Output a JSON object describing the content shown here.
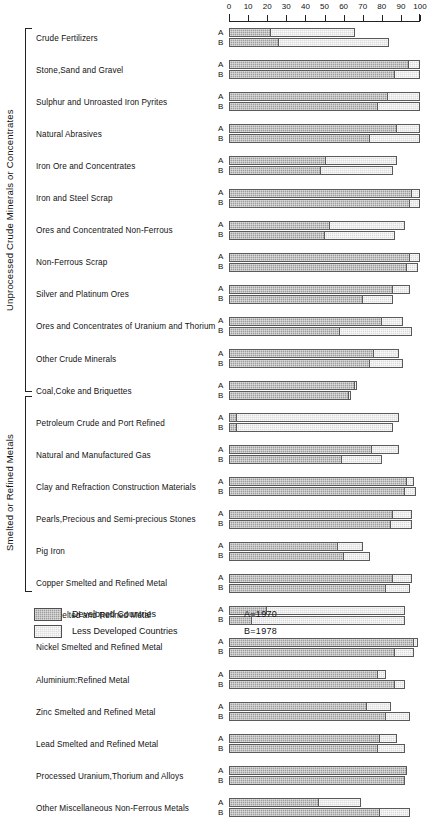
{
  "chart_data": {
    "type": "bar",
    "subtype": "grouped-stacked-horizontal",
    "title": "",
    "xlabel": "",
    "ylabel": "",
    "xlim": [
      0,
      100
    ],
    "xticks": [
      0,
      10,
      20,
      30,
      40,
      50,
      60,
      70,
      80,
      90,
      100
    ],
    "xtick_labels": [
      "0",
      "10",
      "20",
      "30",
      "40",
      "50",
      "60",
      "70",
      "80",
      "90",
      "100"
    ],
    "grid": false,
    "legend_position": "bottom-left",
    "series": [
      {
        "name": "Developed Countries",
        "key": "developed",
        "color": "#9d9d9d"
      },
      {
        "name": "Less Developed Countries",
        "key": "less_developed",
        "color": "#dcdcdc"
      }
    ],
    "row_series_tags": [
      {
        "tag": "A",
        "note": "A=1970"
      },
      {
        "tag": "B",
        "note": "B=1978"
      }
    ],
    "groups": [
      {
        "name": "Unprocessed Crude Minerals or Concentrates",
        "categories": [
          {
            "label": "Crude Fertilizers",
            "A": {
              "developed": 22,
              "less_developed": 44
            },
            "B": {
              "developed": 26,
              "less_developed": 58
            }
          },
          {
            "label": "Stone,Sand and Gravel",
            "A": {
              "developed": 94,
              "less_developed": 6
            },
            "B": {
              "developed": 87,
              "less_developed": 13
            }
          },
          {
            "label": "Sulphur and Unroasted Iron Pyrites",
            "A": {
              "developed": 83,
              "less_developed": 17
            },
            "B": {
              "developed": 78,
              "less_developed": 22
            }
          },
          {
            "label": "Natural Abrasives",
            "A": {
              "developed": 88,
              "less_developed": 12
            },
            "B": {
              "developed": 74,
              "less_developed": 26
            }
          },
          {
            "label": "Iron Ore and Concentrates",
            "A": {
              "developed": 51,
              "less_developed": 37
            },
            "B": {
              "developed": 48,
              "less_developed": 38
            }
          },
          {
            "label": "Iron and Steel Scrap",
            "A": {
              "developed": 96,
              "less_developed": 4
            },
            "B": {
              "developed": 95,
              "less_developed": 5
            }
          },
          {
            "label": "Ores and Concentrated Non-Ferrous",
            "A": {
              "developed": 53,
              "less_developed": 39
            },
            "B": {
              "developed": 50,
              "less_developed": 37
            }
          },
          {
            "label": "Non-Ferrous Scrap",
            "A": {
              "developed": 95,
              "less_developed": 5
            },
            "B": {
              "developed": 93,
              "less_developed": 6
            }
          },
          {
            "label": "Silver and Platinum Ores",
            "A": {
              "developed": 86,
              "less_developed": 9
            },
            "B": {
              "developed": 70,
              "less_developed": 16
            }
          },
          {
            "label": "Ores and Concentrates of Uranium and Thorium",
            "A": {
              "developed": 80,
              "less_developed": 11
            },
            "B": {
              "developed": 58,
              "less_developed": 38
            }
          },
          {
            "label": "Other Crude Minerals",
            "A": {
              "developed": 76,
              "less_developed": 13
            },
            "B": {
              "developed": 74,
              "less_developed": 17
            }
          },
          {
            "label": "Coal,Coke and Briquettes",
            "A": {
              "developed": 66,
              "less_developed": 1
            },
            "B": {
              "developed": 63,
              "less_developed": 1
            }
          },
          {
            "label": "Petroleum Crude and Port Refined",
            "A": {
              "developed": 4,
              "less_developed": 85
            },
            "B": {
              "developed": 4,
              "less_developed": 82
            }
          },
          {
            "label": "Natural and Manufactured Gas",
            "A": {
              "developed": 75,
              "less_developed": 14
            },
            "B": {
              "developed": 59,
              "less_developed": 21
            }
          },
          {
            "label": "Clay and Refraction Construction Materials",
            "A": {
              "developed": 93,
              "less_developed": 4
            },
            "B": {
              "developed": 92,
              "less_developed": 6
            }
          },
          {
            "label": "Pearls,Precious and Semi-precious Stones",
            "A": {
              "developed": 86,
              "less_developed": 10
            },
            "B": {
              "developed": 85,
              "less_developed": 11
            }
          }
        ]
      },
      {
        "name": "Smelted or Refined Metals",
        "categories": [
          {
            "label": "Pig Iron",
            "A": {
              "developed": 57,
              "less_developed": 13
            },
            "B": {
              "developed": 60,
              "less_developed": 14
            }
          },
          {
            "label": "Copper Smelted and Refined Metal",
            "A": {
              "developed": 86,
              "less_developed": 10
            },
            "B": {
              "developed": 82,
              "less_developed": 13
            }
          },
          {
            "label": "Tin Smelted and Refined Metal",
            "A": {
              "developed": 20,
              "less_developed": 72
            },
            "B": {
              "developed": 12,
              "less_developed": 80
            }
          },
          {
            "label": "Nickel Smelted and Refined Metal",
            "A": {
              "developed": 97,
              "less_developed": 2
            },
            "B": {
              "developed": 87,
              "less_developed": 10
            }
          },
          {
            "label": "Aluminium:Refined Metal",
            "A": {
              "developed": 78,
              "less_developed": 4
            },
            "B": {
              "developed": 87,
              "less_developed": 5
            }
          },
          {
            "label": "Zinc Smelted and Refined Metal",
            "A": {
              "developed": 72,
              "less_developed": 13
            },
            "B": {
              "developed": 82,
              "less_developed": 13
            }
          },
          {
            "label": "Lead Smelted and Refined Metal",
            "A": {
              "developed": 79,
              "less_developed": 9
            },
            "B": {
              "developed": 78,
              "less_developed": 14
            }
          },
          {
            "label": "Processed Uranium,Thorium and Alloys",
            "A": {
              "developed": 93,
              "less_developed": 0
            },
            "B": {
              "developed": 92,
              "less_developed": 0
            }
          },
          {
            "label": "Other Miscellaneous Non-Ferrous Metals",
            "A": {
              "developed": 47,
              "less_developed": 22
            },
            "B": {
              "developed": 79,
              "less_developed": 16
            }
          }
        ]
      }
    ]
  },
  "legend": {
    "items": [
      {
        "label": "Developed Countries",
        "swatch": "developed"
      },
      {
        "label": "Less Developed Countries",
        "swatch": "less_developed"
      }
    ],
    "notes": [
      "A=1970",
      "B=1978"
    ]
  }
}
